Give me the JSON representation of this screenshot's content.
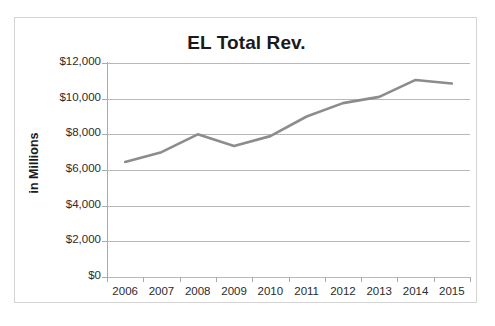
{
  "chart_data": {
    "type": "line",
    "title": "EL Total Rev.",
    "xlabel": "",
    "ylabel": "in Millions",
    "categories": [
      "2006",
      "2007",
      "2008",
      "2009",
      "2010",
      "2011",
      "2012",
      "2013",
      "2014",
      "2015"
    ],
    "series": [
      {
        "name": "EL Total Rev.",
        "values": [
          6450,
          7000,
          8000,
          7350,
          7900,
          9000,
          9750,
          10100,
          11050,
          10850
        ],
        "color": "#8c8c8c"
      }
    ],
    "ylim": [
      0,
      12000
    ],
    "y_ticks": [
      0,
      2000,
      4000,
      6000,
      8000,
      10000,
      12000
    ],
    "y_tick_labels": [
      "$0",
      "$2,000",
      "$4,000",
      "$6,000",
      "$8,000",
      "$10,000",
      "$12,000"
    ],
    "grid": true,
    "grid_color": "#b8b8b8",
    "legend": false,
    "legend_position": "none",
    "markers": false,
    "background": "#ffffff",
    "border_color": "#d4d4d4",
    "axis_color": "#a9a9a9",
    "text_color": "#1a1a1a"
  }
}
